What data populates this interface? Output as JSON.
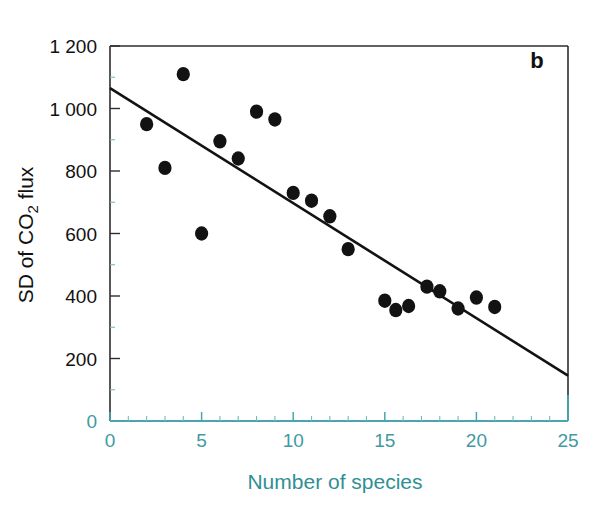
{
  "panel": {
    "label": "b"
  },
  "axes": {
    "x_title": "Number of species",
    "y_title_main": "SD of CO",
    "y_title_sub": "2",
    "y_title_tail": " flux",
    "x_ticks": [
      "0",
      "5",
      "10",
      "15",
      "20",
      "25"
    ],
    "y_ticks": [
      "0",
      "200",
      "400",
      "600",
      "800",
      "1 000",
      "1 200"
    ]
  },
  "colors": {
    "teal": "#3f9aa3",
    "teal_axis": "#4aa6ae",
    "point": "#121212",
    "trend": "#121212",
    "text": "#111111"
  },
  "chart_data": {
    "type": "scatter",
    "title": "",
    "xlabel": "Number of species",
    "ylabel": "SD of CO2 flux",
    "xlim": [
      0,
      25
    ],
    "ylim": [
      0,
      1200
    ],
    "grid": false,
    "legend": null,
    "xticks": [
      0,
      5,
      10,
      15,
      20,
      25
    ],
    "yticks": [
      0,
      200,
      400,
      600,
      800,
      1000,
      1200
    ],
    "x_minor_tick_interval": 1,
    "y_minor_tick_interval": 100,
    "annotations": [
      "b"
    ],
    "points": [
      {
        "x": 2,
        "y": 950
      },
      {
        "x": 3,
        "y": 810
      },
      {
        "x": 4,
        "y": 1110
      },
      {
        "x": 5,
        "y": 600
      },
      {
        "x": 6,
        "y": 895
      },
      {
        "x": 7,
        "y": 840
      },
      {
        "x": 8,
        "y": 990
      },
      {
        "x": 9,
        "y": 965
      },
      {
        "x": 10,
        "y": 730
      },
      {
        "x": 11,
        "y": 705
      },
      {
        "x": 12,
        "y": 655
      },
      {
        "x": 13,
        "y": 550
      },
      {
        "x": 15,
        "y": 385
      },
      {
        "x": 15.6,
        "y": 355
      },
      {
        "x": 16.3,
        "y": 368
      },
      {
        "x": 17.3,
        "y": 430
      },
      {
        "x": 18,
        "y": 415
      },
      {
        "x": 19,
        "y": 360
      },
      {
        "x": 20,
        "y": 395
      },
      {
        "x": 21,
        "y": 365
      }
    ],
    "series": [
      {
        "name": "SD of CO2 flux",
        "x": [
          2,
          3,
          4,
          5,
          6,
          7,
          8,
          9,
          10,
          11,
          12,
          13,
          15,
          15.6,
          16.3,
          17.3,
          18,
          19,
          20,
          21
        ],
        "values": [
          950,
          810,
          1110,
          600,
          895,
          840,
          990,
          965,
          730,
          705,
          655,
          550,
          385,
          355,
          368,
          430,
          415,
          360,
          395,
          365
        ]
      }
    ],
    "trendline": {
      "type": "linear",
      "x_start": 0,
      "y_start": 1065,
      "x_end": 25,
      "y_end": 145,
      "slope": -36.8,
      "intercept": 1065
    }
  }
}
